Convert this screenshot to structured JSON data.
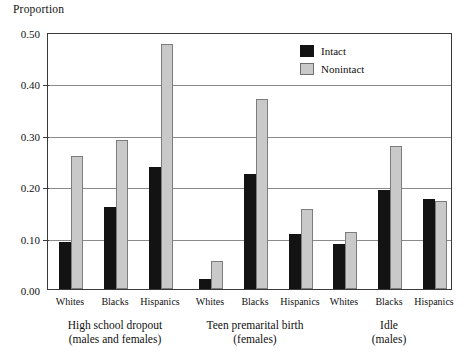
{
  "chart_data": {
    "type": "bar",
    "title": "",
    "ylabel": "Proportion",
    "xlabel": "",
    "ylim": [
      0.0,
      0.5
    ],
    "yticks": [
      "0.00",
      "0.10",
      "0.20",
      "0.30",
      "0.40",
      "0.50"
    ],
    "ytick_values": [
      0.0,
      0.1,
      0.2,
      0.3,
      0.4,
      0.5
    ],
    "grid": "horizontal",
    "legend_position": "top-right",
    "legend": [
      "Intact",
      "Nonintact"
    ],
    "series": [
      {
        "name": "Intact",
        "color": "#131313",
        "values": [
          0.091,
          0.16,
          0.237,
          0.02,
          0.224,
          0.107,
          0.088,
          0.193,
          0.175
        ]
      },
      {
        "name": "Nonintact",
        "color": "#c9c9c9",
        "values": [
          0.259,
          0.289,
          0.477,
          0.055,
          0.37,
          0.156,
          0.11,
          0.278,
          0.172
        ]
      }
    ],
    "categories": [
      "Whites",
      "Blacks",
      "Hispanics",
      "Whites",
      "Blacks",
      "Hispanics",
      "Whites",
      "Blacks",
      "Hispanics"
    ],
    "groups": [
      {
        "caption_line1": "High school dropout",
        "caption_line2": "(males and females)",
        "categories": [
          "Whites",
          "Blacks",
          "Hispanics"
        ]
      },
      {
        "caption_line1": "Teen premarital birth",
        "caption_line2": "(females)",
        "categories": [
          "Whites",
          "Blacks",
          "Hispanics"
        ]
      },
      {
        "caption_line1": "Idle",
        "caption_line2": "(males)",
        "categories": [
          "Whites",
          "Blacks",
          "Hispanics"
        ]
      }
    ]
  }
}
